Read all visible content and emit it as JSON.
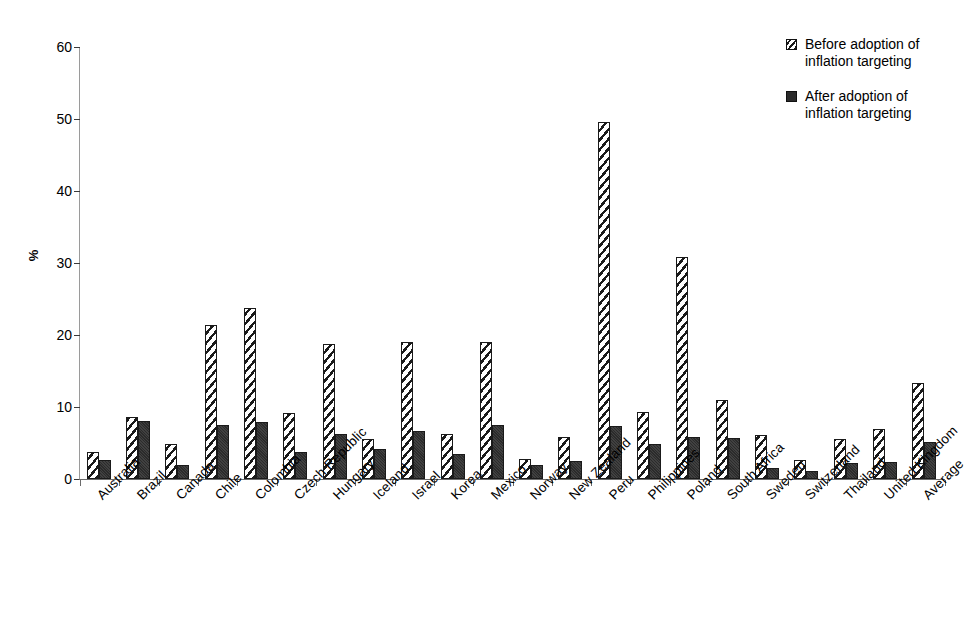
{
  "chart_data": {
    "type": "bar",
    "title": "",
    "xlabel": "",
    "ylabel": "%",
    "ylim": [
      0,
      60
    ],
    "yticks": [
      0,
      10,
      20,
      30,
      40,
      50,
      60
    ],
    "grid": false,
    "legend_position": "top-right",
    "categories": [
      "Australia",
      "Brazil",
      "Canada",
      "Chile",
      "Colombia",
      "Czech Republic",
      "Hungary",
      "Iceland",
      "Israel",
      "Korea",
      "Mexico",
      "Norway",
      "New Zealand",
      "Peru",
      "Philippines",
      "Poland",
      "South Africa",
      "Sweden",
      "Switzerland",
      "Thailand",
      "United Kingdom",
      "Average"
    ],
    "series": [
      {
        "name": "Before adoption of inflation targeting",
        "values": [
          3.7,
          8.6,
          4.8,
          21.4,
          23.7,
          9.2,
          18.8,
          5.5,
          19.0,
          6.3,
          19.0,
          2.8,
          5.9,
          49.6,
          9.3,
          30.9,
          11.0,
          6.1,
          2.7,
          5.6,
          7.0,
          13.3
        ]
      },
      {
        "name": "After adoption of inflation targeting",
        "values": [
          2.7,
          8.1,
          2.0,
          7.5,
          7.9,
          3.8,
          6.2,
          4.1,
          6.7,
          3.5,
          7.5,
          2.0,
          2.5,
          7.3,
          4.8,
          5.8,
          5.7,
          1.5,
          1.1,
          2.2,
          2.4,
          5.1
        ]
      }
    ]
  },
  "legend": {
    "items": [
      {
        "swatch": "hatched-square-icon",
        "line1": "Before adoption of",
        "line2": "inflation targeting"
      },
      {
        "swatch": "filled-square-icon",
        "line1": "After adoption of",
        "line2": "inflation targeting"
      }
    ]
  },
  "colors": {
    "before_fill": "#ffffff",
    "before_stroke": "#1a1a1a",
    "after_fill": "#2b2b2b",
    "axis": "#6b6b6b",
    "text": "#000000",
    "background": "#ffffff"
  }
}
